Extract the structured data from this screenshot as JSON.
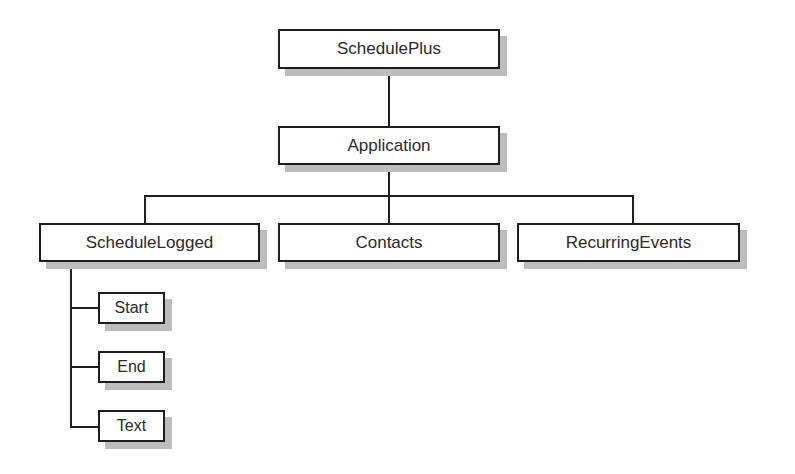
{
  "diagram": {
    "type": "object-hierarchy",
    "colors": {
      "border": "#1e1e1e",
      "shadow": "#bdbdbd",
      "text": "#2a2a2a",
      "background": "#ffffff"
    },
    "nodes": {
      "root": "SchedulePlus",
      "application": "Application",
      "schedule_logged": "ScheduleLogged",
      "contacts": "Contacts",
      "recurring_events": "RecurringEvents",
      "start": "Start",
      "end": "End",
      "text": "Text"
    },
    "edges": [
      [
        "SchedulePlus",
        "Application"
      ],
      [
        "Application",
        "ScheduleLogged"
      ],
      [
        "Application",
        "Contacts"
      ],
      [
        "Application",
        "RecurringEvents"
      ],
      [
        "ScheduleLogged",
        "Start"
      ],
      [
        "ScheduleLogged",
        "End"
      ],
      [
        "ScheduleLogged",
        "Text"
      ]
    ]
  }
}
